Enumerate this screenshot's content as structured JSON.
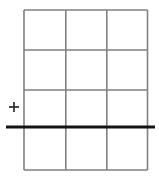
{
  "figure": {
    "width": 159,
    "height": 186,
    "background_color": "#ffffff"
  },
  "grid": {
    "name": "table-grid",
    "columns": 3,
    "rows": 4,
    "left": 24,
    "right": 147.5,
    "top": 10,
    "bottom": 170,
    "line_color": "#808080",
    "line_width": 1.6,
    "vertical_lines_x": [
      24,
      65.8,
      106.8,
      147.5
    ],
    "horizontal_lines_y": [
      10,
      50,
      90,
      170
    ]
  },
  "rule": {
    "name": "thick-horizontal-rule",
    "x_start": 6,
    "x_end": 155,
    "y": 127,
    "color": "#141414",
    "line_width": 3.2
  },
  "marker": {
    "name": "plus-marker",
    "glyph": "+",
    "center_x": 14,
    "center_y": 107,
    "size": 10,
    "color": "#2b2b2b",
    "line_width": 1.7
  }
}
